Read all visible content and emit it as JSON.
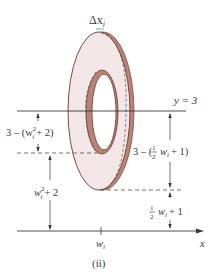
{
  "figure": {
    "caption": "(ii)",
    "colors": {
      "ring_fill": "#f2e6e6",
      "ring_edge": "#8c4a3f",
      "ring_band": "#b98478",
      "line": "#3a3a3a",
      "text": "#3a3a3a"
    },
    "labels": {
      "delta_x": "Δx",
      "delta_x_sub": "i",
      "line_y": "y = 3",
      "left_top_prefix": "3 – (w",
      "left_top_sub": "i",
      "left_top_sup": "2",
      "left_top_suffix": "+ 2)",
      "left_bottom_prefix": "w",
      "left_bottom_sub": "i",
      "left_bottom_sup": "2",
      "left_bottom_suffix": "+ 2",
      "right_top_prefix": "3 – (",
      "right_top_frac_num": "1",
      "right_top_frac_den": "2",
      "right_top_var": "w",
      "right_top_sub": "i",
      "right_top_suffix": "+ 1)",
      "right_bottom_frac_num": "1",
      "right_bottom_frac_den": "2",
      "right_bottom_var": "w",
      "right_bottom_sub": "i",
      "right_bottom_suffix": "+ 1",
      "tick_label": "w",
      "tick_sub": "i",
      "x_axis": "x"
    }
  }
}
